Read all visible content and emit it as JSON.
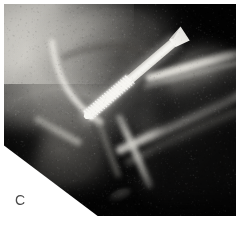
{
  "figure": {
    "type": "medical-radiograph",
    "modality": "X-ray",
    "panel_letter": "C",
    "background_color": "#ffffff",
    "plate": {
      "x": 4,
      "y": 4,
      "width": 232,
      "height": 212,
      "base_color": "#0a0a0a",
      "corner_cut": "bottom-left diagonal white wedge"
    },
    "anatomy": {
      "region": "proximal femur / hip joint",
      "view": "oblique lateral",
      "description": "Radiograph of proximal femur with acetabulum and femoral head, showing a single cannulated lag screw traversing the femoral neck."
    },
    "implant": {
      "name": "cannulated screw",
      "appearance": "bright white threaded cylinder",
      "head_position": {
        "x": 174,
        "y": 42
      },
      "tip_position": {
        "x": 87,
        "y": 116
      },
      "angle_degrees": -39,
      "length_px": 115,
      "shaft_width_px": 9,
      "color": "#f6f6f2"
    },
    "features": [
      {
        "name": "femoral-head-outline",
        "brightness": "mid-gray",
        "x": 62,
        "y": 75
      },
      {
        "name": "acetabular-rim",
        "brightness": "bright",
        "x": 70,
        "y": 60
      },
      {
        "name": "cortical-band-upper-right",
        "brightness": "bright",
        "x": 190,
        "y": 70
      },
      {
        "name": "cortical-band-lower-right",
        "brightness": "bright",
        "x": 180,
        "y": 140
      },
      {
        "name": "femoral-shaft-cortex",
        "brightness": "bright",
        "x": 130,
        "y": 160
      },
      {
        "name": "soft-tissue-shadow-left",
        "brightness": "light-gray",
        "x": 25,
        "y": 45
      },
      {
        "name": "dark-background-upper-right",
        "brightness": "black",
        "x": 215,
        "y": 25
      }
    ]
  },
  "colors": {
    "page_background": "#ffffff",
    "plate_black": "#0a0a0a",
    "bone_bright": "#e8e6e0",
    "bone_mid": "#8e8c87",
    "soft_tissue": "#b9b7b1",
    "implant_white": "#f8f7f3",
    "label_gray": "#4a4a4a"
  }
}
